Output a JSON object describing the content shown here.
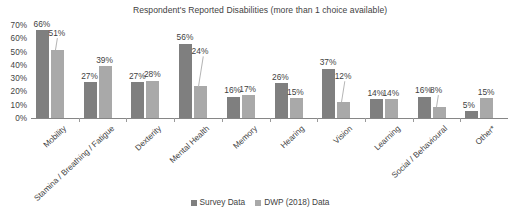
{
  "chart_data": {
    "type": "bar",
    "title": "Respondent's Reported Disabilities (more than 1 choice available)",
    "xlabel": "",
    "ylabel": "",
    "ylim": [
      0,
      70
    ],
    "ytick_labels": [
      "70%",
      "60%",
      "50%",
      "40%",
      "30%",
      "20%",
      "10%",
      "0%"
    ],
    "ytick_values": [
      70,
      60,
      50,
      40,
      30,
      20,
      10,
      0
    ],
    "grid": false,
    "legend_position": "bottom",
    "categories": [
      "Mobility",
      "Stamina / Breathing / Fatigue",
      "Dexterity",
      "Mental Health",
      "Memory",
      "Hearing",
      "Vision",
      "Learning",
      "Social / Behavioural",
      "Other*"
    ],
    "series": [
      {
        "name": "Survey Data",
        "color": "#7f7f7f",
        "values": [
          66,
          27,
          27,
          56,
          16,
          26,
          37,
          14,
          16,
          5
        ],
        "labels": [
          "66%",
          "27%",
          "27%",
          "56%",
          "16%",
          "26%",
          "37%",
          "14%",
          "16%",
          "5%"
        ]
      },
      {
        "name": "DWP (2018) Data",
        "color": "#a9a9a9",
        "values": [
          51,
          39,
          28,
          24,
          17,
          15,
          12,
          14,
          8,
          15
        ],
        "labels": [
          "51%",
          "39%",
          "28%",
          "24%",
          "17%",
          "15%",
          "12%",
          "14%",
          "8%",
          "15%"
        ]
      }
    ]
  },
  "legend": {
    "items": [
      {
        "label": "Survey Data"
      },
      {
        "label": "DWP (2018) Data"
      }
    ]
  }
}
